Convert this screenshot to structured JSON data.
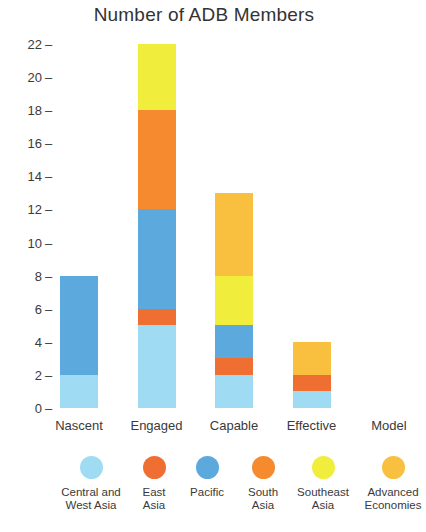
{
  "chart_data": {
    "type": "bar",
    "subtype": "stacked-bar",
    "title": "Number of ADB Members",
    "xlabel": "",
    "ylabel": "",
    "categories": [
      "Nascent",
      "Engaged",
      "Capable",
      "Effective",
      "Model"
    ],
    "ylim": [
      0,
      22
    ],
    "yticks": [
      0,
      2,
      4,
      6,
      8,
      10,
      12,
      14,
      16,
      18,
      20,
      22
    ],
    "ytick_labels": [
      "0",
      "2",
      "4",
      "6",
      "8",
      "10",
      "12",
      "14",
      "16",
      "18",
      "20",
      "22"
    ],
    "grid": false,
    "legend_position": "bottom",
    "series": [
      {
        "name": "Central and West Asia",
        "legend_label": "Central and\nWest Asia",
        "color": "#9fdcf4",
        "values": [
          2,
          5,
          2,
          1,
          0
        ]
      },
      {
        "name": "East Asia",
        "legend_label": "East\nAsia",
        "color": "#ef6f33",
        "values": [
          0,
          1,
          1,
          1,
          0
        ]
      },
      {
        "name": "Pacific",
        "legend_label": "Pacific",
        "color": "#5ba9dd",
        "values": [
          6,
          6,
          2,
          0,
          0
        ]
      },
      {
        "name": "South Asia",
        "legend_label": "South\nAsia",
        "color": "#f58a2e",
        "values": [
          0,
          6,
          0,
          0,
          0
        ]
      },
      {
        "name": "Southeast Asia",
        "legend_label": "Southeast\nAsia",
        "color": "#f1ed3c",
        "values": [
          0,
          4,
          3,
          0,
          0
        ]
      },
      {
        "name": "Advanced Economies",
        "legend_label": "Advanced\nEconomies",
        "color": "#f9bf3f",
        "values": [
          0,
          0,
          5,
          2,
          0
        ]
      }
    ],
    "totals": [
      8,
      22,
      13,
      4,
      0
    ]
  }
}
